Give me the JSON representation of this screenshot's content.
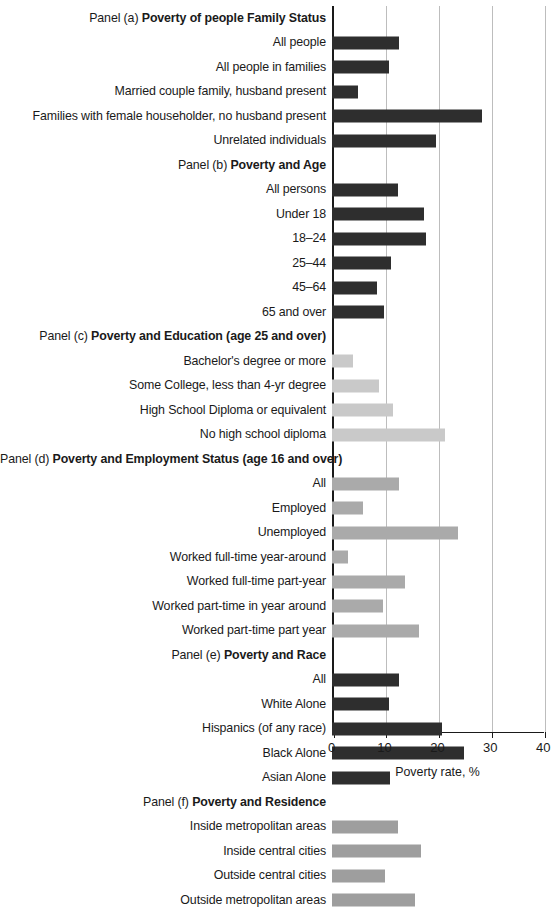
{
  "chart_data": {
    "type": "bar",
    "orientation": "horizontal",
    "title": "",
    "xlabel": "Poverty rate, %",
    "ylabel": "",
    "xlim": [
      0,
      40
    ],
    "xticks": [
      0,
      10,
      20,
      30,
      40
    ],
    "xtick_labels": [
      "0",
      "10",
      "20",
      "30",
      "40"
    ],
    "grid": "vertical",
    "legend": "none",
    "panels": [
      {
        "id": "a",
        "panel_number": "Panel (a)",
        "panel_title": "Poverty of people Family Status",
        "bar_color": "#2e2e2e",
        "categories": [
          "All people",
          "All people in families",
          "Married couple family, husband present",
          "Families with female householder, no husband present",
          "Unrelated individuals"
        ],
        "values": [
          12.6,
          10.7,
          5.0,
          28.3,
          19.7
        ]
      },
      {
        "id": "b",
        "panel_number": "Panel (b)",
        "panel_title": "Poverty and Age",
        "bar_color": "#2e2e2e",
        "categories": [
          "All persons",
          "Under 18",
          "18–24",
          "25–44",
          "45–64",
          "65 and over"
        ],
        "values": [
          12.4,
          17.3,
          17.8,
          11.2,
          8.5,
          9.9
        ]
      },
      {
        "id": "c",
        "panel_number": "Panel (c)",
        "panel_title": "Poverty and Education (age 25 and over)",
        "bar_color": "#c9c9c9",
        "categories": [
          "Bachelor's degree or more",
          "Some College, less than 4-yr degree",
          "High School Diploma or equivalent",
          "No high school diploma"
        ],
        "values": [
          4.0,
          8.9,
          11.6,
          21.3
        ]
      },
      {
        "id": "d",
        "panel_number": "Panel (d)",
        "panel_title": "Poverty and Employment Status (age 16 and over)",
        "bar_color": "#aaaaaa",
        "categories": [
          "All",
          "Employed",
          "Unemployed",
          "Worked full-time year-around",
          "Worked full-time part-year",
          "Worked part-time in year around",
          "Worked part-time part year"
        ],
        "values": [
          12.6,
          5.9,
          23.8,
          3.1,
          13.7,
          9.7,
          16.4
        ]
      },
      {
        "id": "e",
        "panel_number": "Panel (e)",
        "panel_title": "Poverty and Race",
        "bar_color": "#2e2e2e",
        "categories": [
          "All",
          "White Alone",
          "Hispanics (of any race)",
          "Black Alone",
          "Asian Alone"
        ],
        "values": [
          12.7,
          10.8,
          20.7,
          25.0,
          11.0
        ]
      },
      {
        "id": "f",
        "panel_number": "Panel (f)",
        "panel_title": "Poverty and Residence",
        "bar_color": "#9e9e9e",
        "categories": [
          "Inside metropolitan areas",
          "Inside central cities",
          "Outside central cities",
          "Outside metropolitan areas"
        ],
        "values": [
          12.4,
          16.9,
          10.1,
          15.6
        ]
      }
    ]
  }
}
